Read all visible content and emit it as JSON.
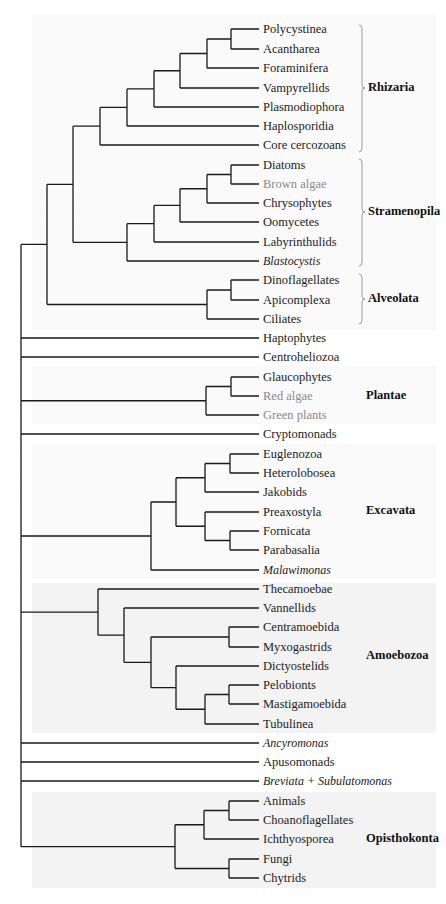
{
  "figure": {
    "type": "phylogenetic-tree",
    "leaves": [
      {
        "name": "Polycystinea",
        "y": 29,
        "style": "normal"
      },
      {
        "name": "Acantharea",
        "y": 49,
        "style": "normal"
      },
      {
        "name": "Foraminifera",
        "y": 68,
        "style": "normal"
      },
      {
        "name": "Vampyrellids",
        "y": 88,
        "style": "normal"
      },
      {
        "name": "Plasmodiophora",
        "y": 107,
        "style": "normal"
      },
      {
        "name": "Haplosporidia",
        "y": 126,
        "style": "normal"
      },
      {
        "name": "Core cercozoans",
        "y": 145,
        "style": "normal"
      },
      {
        "name": "Diatoms",
        "y": 165,
        "style": "normal"
      },
      {
        "name": "Brown algae",
        "y": 184,
        "style": "gray"
      },
      {
        "name": "Chrysophytes",
        "y": 203,
        "style": "normal"
      },
      {
        "name": "Oomycetes",
        "y": 222,
        "style": "normal"
      },
      {
        "name": "Labyrinthulids",
        "y": 242,
        "style": "normal"
      },
      {
        "name": "Blastocystis",
        "y": 261,
        "style": "italic"
      },
      {
        "name": "Dinoflagellates",
        "y": 280,
        "style": "normal"
      },
      {
        "name": "Apicomplexa",
        "y": 300,
        "style": "normal"
      },
      {
        "name": "Ciliates",
        "y": 319,
        "style": "normal"
      },
      {
        "name": "Haptophytes",
        "y": 338,
        "style": "normal"
      },
      {
        "name": "Centroheliozoa",
        "y": 357,
        "style": "normal"
      },
      {
        "name": "Glaucophytes",
        "y": 377,
        "style": "normal"
      },
      {
        "name": "Red algae",
        "y": 396,
        "style": "gray"
      },
      {
        "name": "Green plants",
        "y": 415,
        "style": "gray"
      },
      {
        "name": "Cryptomonads",
        "y": 434,
        "style": "normal"
      },
      {
        "name": "Euglenozoa",
        "y": 454,
        "style": "normal"
      },
      {
        "name": "Heterolobosea",
        "y": 473,
        "style": "normal"
      },
      {
        "name": "Jakobids",
        "y": 492,
        "style": "normal"
      },
      {
        "name": "Preaxostyla",
        "y": 512,
        "style": "normal"
      },
      {
        "name": "Fornicata",
        "y": 531,
        "style": "normal"
      },
      {
        "name": "Parabasalia",
        "y": 550,
        "style": "normal"
      },
      {
        "name": "Malawimonas",
        "y": 570,
        "style": "italic"
      },
      {
        "name": "Thecamoebae",
        "y": 589,
        "style": "normal"
      },
      {
        "name": "Vannellids",
        "y": 608,
        "style": "normal"
      },
      {
        "name": "Centramoebida",
        "y": 627,
        "style": "normal"
      },
      {
        "name": "Myxogastrids",
        "y": 647,
        "style": "normal"
      },
      {
        "name": "Dictyostelids",
        "y": 666,
        "style": "normal"
      },
      {
        "name": "Pelobionts",
        "y": 685,
        "style": "normal"
      },
      {
        "name": "Mastigamoebida",
        "y": 704,
        "style": "normal"
      },
      {
        "name": "Tubulinea",
        "y": 724,
        "style": "normal"
      },
      {
        "name": "Ancyromonas",
        "y": 743,
        "style": "italic"
      },
      {
        "name": "Apusomonads",
        "y": 762,
        "style": "normal"
      },
      {
        "name": "Breviata + Subulatomonas",
        "y": 781,
        "style": "italic"
      },
      {
        "name": "Animals",
        "y": 801,
        "style": "normal"
      },
      {
        "name": "Choanoflagellates",
        "y": 820,
        "style": "normal"
      },
      {
        "name": "Ichthyosporea",
        "y": 839,
        "style": "normal"
      },
      {
        "name": "Fungi",
        "y": 859,
        "style": "normal"
      },
      {
        "name": "Chytrids",
        "y": 878,
        "style": "normal"
      }
    ],
    "clades": [
      {
        "name": "Rhizaria",
        "y": 88,
        "bracket": [
          25,
          152
        ]
      },
      {
        "name": "Stramenopila",
        "y": 212,
        "bracket": [
          159,
          266
        ]
      },
      {
        "name": "Alveolata",
        "y": 299,
        "bracket": [
          274,
          324
        ]
      },
      {
        "name": "Plantae",
        "y": 396,
        "bracket": null
      },
      {
        "name": "Excavata",
        "y": 511,
        "bracket": null
      },
      {
        "name": "Amoebozoa",
        "y": 656,
        "bracket": null
      },
      {
        "name": "Opisthokonta",
        "y": 839,
        "bracket": null
      }
    ],
    "colors": {
      "line": "#1a1a1a",
      "bracket": "#9a9a9a",
      "shade": "#f3f3f3",
      "gray_text": "#8a8a8a"
    }
  }
}
